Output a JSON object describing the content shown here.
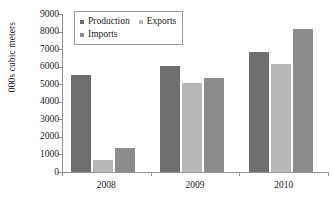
{
  "chart_data": {
    "type": "bar",
    "title": "",
    "xlabel": "",
    "ylabel": "000s cubic meters",
    "categories": [
      "2008",
      "2009",
      "2010"
    ],
    "series": [
      {
        "name": "Production",
        "values": [
          5525,
          6040,
          6830
        ],
        "color": "#6e6e6e"
      },
      {
        "name": "Exports",
        "values": [
          690,
          5060,
          6140
        ],
        "color": "#b8b8b8"
      },
      {
        "name": "Imports",
        "values": [
          1360,
          5350,
          8140
        ],
        "color": "#8c8c8c"
      }
    ],
    "ylim": [
      0,
      9000
    ],
    "yticks": [
      0,
      1000,
      2000,
      3000,
      4000,
      5000,
      6000,
      7000,
      8000,
      9000
    ],
    "ytick_labels": [
      "0",
      "1000",
      "2000",
      "3000",
      "4000",
      "5000",
      "6000",
      "7000",
      "8000",
      "9000"
    ],
    "grid": false,
    "legend_position": "top-left-inside",
    "legend_entries": [
      "Production",
      "Exports",
      "Imports"
    ],
    "axis_color": "#909090",
    "background": "#ffffff"
  }
}
